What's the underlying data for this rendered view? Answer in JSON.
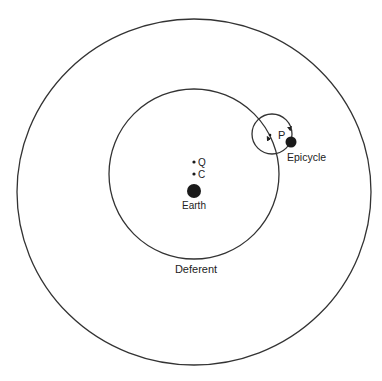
{
  "diagram": {
    "colors": {
      "stroke": "#222222",
      "fill": "#1a1a1a",
      "background": "#ffffff"
    },
    "outer_circle": {
      "cx": 194,
      "cy": 192,
      "rx": 177,
      "ry": 173
    },
    "deferent": {
      "label": "Deferent",
      "cx": 194,
      "cy": 174,
      "r": 85
    },
    "epicycle": {
      "label": "Epicycle",
      "center_label": "P",
      "cx": 272,
      "cy": 134,
      "r": 20
    },
    "planet": {
      "cx": 291,
      "cy": 142,
      "r": 5.5
    },
    "earth": {
      "label": "Earth",
      "cx": 194,
      "cy": 191,
      "r": 7
    },
    "points": [
      {
        "label": "Q",
        "cx": 194,
        "cy": 162
      },
      {
        "label": "C",
        "cx": 194,
        "cy": 174
      }
    ]
  }
}
